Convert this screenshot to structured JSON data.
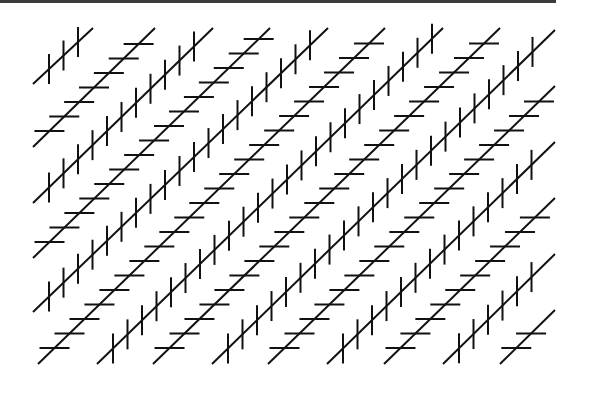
{
  "figure": {
    "kind": "Zollner illusion",
    "background": "#ffffff",
    "stroke_color": "#111111",
    "border_color": "#3a3a3a",
    "tick_half_length": 15,
    "tick_spacing": 14.5,
    "tick_offset": 16,
    "lines": [
      {
        "type": "vertical-ticks",
        "x1": 33,
        "y1": 84,
        "x2": 93,
        "y2": 28
      },
      {
        "type": "horizontal-ticks",
        "x1": 33,
        "y1": 147,
        "x2": 155,
        "y2": 28
      },
      {
        "type": "vertical-ticks",
        "x1": 33,
        "y1": 203,
        "x2": 213,
        "y2": 28
      },
      {
        "type": "horizontal-ticks",
        "x1": 33,
        "y1": 258,
        "x2": 270,
        "y2": 28
      },
      {
        "type": "vertical-ticks",
        "x1": 33,
        "y1": 312,
        "x2": 328,
        "y2": 28
      },
      {
        "type": "horizontal-ticks",
        "x1": 38,
        "y1": 364,
        "x2": 385,
        "y2": 28
      },
      {
        "type": "vertical-ticks",
        "x1": 97,
        "y1": 364,
        "x2": 443,
        "y2": 28
      },
      {
        "type": "horizontal-ticks",
        "x1": 153,
        "y1": 364,
        "x2": 500,
        "y2": 28
      },
      {
        "type": "vertical-ticks",
        "x1": 212,
        "y1": 364,
        "x2": 555,
        "y2": 30
      },
      {
        "type": "horizontal-ticks",
        "x1": 268,
        "y1": 364,
        "x2": 555,
        "y2": 86
      },
      {
        "type": "vertical-ticks",
        "x1": 327,
        "y1": 364,
        "x2": 555,
        "y2": 142
      },
      {
        "type": "horizontal-ticks",
        "x1": 384,
        "y1": 364,
        "x2": 555,
        "y2": 198
      },
      {
        "type": "vertical-ticks",
        "x1": 443,
        "y1": 364,
        "x2": 555,
        "y2": 254
      },
      {
        "type": "horizontal-ticks",
        "x1": 500,
        "y1": 364,
        "x2": 555,
        "y2": 310
      }
    ]
  }
}
